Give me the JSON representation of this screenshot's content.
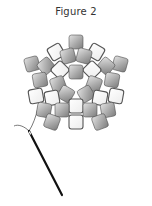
{
  "figure": {
    "title": "Figure 2"
  },
  "colors": {
    "bead_gray_light": "#d8d8d8",
    "bead_gray_dark": "#8a8a8a",
    "bead_white": "#ffffff",
    "bead_outline": "#555555",
    "thread": "#555555",
    "needle": "#111111"
  },
  "beads": [
    {
      "x": 76,
      "y": 42,
      "r": 0,
      "type": "gray"
    },
    {
      "x": 56,
      "y": 52,
      "r": -30,
      "type": "white"
    },
    {
      "x": 96,
      "y": 52,
      "r": 30,
      "type": "white"
    },
    {
      "x": 68,
      "y": 56,
      "r": -15,
      "type": "gray"
    },
    {
      "x": 84,
      "y": 56,
      "r": 15,
      "type": "gray"
    },
    {
      "x": 32,
      "y": 64,
      "r": -15,
      "type": "gray"
    },
    {
      "x": 120,
      "y": 64,
      "r": 15,
      "type": "gray"
    },
    {
      "x": 46,
      "y": 66,
      "r": -40,
      "type": "gray"
    },
    {
      "x": 106,
      "y": 66,
      "r": 40,
      "type": "gray"
    },
    {
      "x": 60,
      "y": 70,
      "r": -45,
      "type": "white"
    },
    {
      "x": 92,
      "y": 70,
      "r": 45,
      "type": "white"
    },
    {
      "x": 76,
      "y": 72,
      "r": 0,
      "type": "gray"
    },
    {
      "x": 40,
      "y": 80,
      "r": -10,
      "type": "gray"
    },
    {
      "x": 112,
      "y": 80,
      "r": 10,
      "type": "gray"
    },
    {
      "x": 58,
      "y": 84,
      "r": -20,
      "type": "gray"
    },
    {
      "x": 94,
      "y": 84,
      "r": 20,
      "type": "gray"
    },
    {
      "x": 66,
      "y": 94,
      "r": 30,
      "type": "gray"
    },
    {
      "x": 86,
      "y": 94,
      "r": -30,
      "type": "gray"
    },
    {
      "x": 36,
      "y": 96,
      "r": -10,
      "type": "white"
    },
    {
      "x": 116,
      "y": 96,
      "r": 10,
      "type": "white"
    },
    {
      "x": 52,
      "y": 98,
      "r": -10,
      "type": "white"
    },
    {
      "x": 100,
      "y": 98,
      "r": 10,
      "type": "white"
    },
    {
      "x": 76,
      "y": 106,
      "r": 0,
      "type": "white"
    },
    {
      "x": 44,
      "y": 110,
      "r": 10,
      "type": "gray"
    },
    {
      "x": 108,
      "y": 110,
      "r": -10,
      "type": "gray"
    },
    {
      "x": 62,
      "y": 110,
      "r": 0,
      "type": "gray"
    },
    {
      "x": 90,
      "y": 110,
      "r": 0,
      "type": "gray"
    },
    {
      "x": 52,
      "y": 122,
      "r": 20,
      "type": "gray"
    },
    {
      "x": 100,
      "y": 122,
      "r": -20,
      "type": "gray"
    },
    {
      "x": 76,
      "y": 122,
      "r": 0,
      "type": "white"
    }
  ],
  "needle": {
    "eye_x": 29,
    "eye_y": 131,
    "tip_x": 62,
    "tip_y": 195
  },
  "thread": {
    "path": "M 29 131 C 24 126, 18 124, 14 126 M 29 131 C 33 125, 36 116, 38 108 C 40 100, 36 92, 36 96"
  }
}
